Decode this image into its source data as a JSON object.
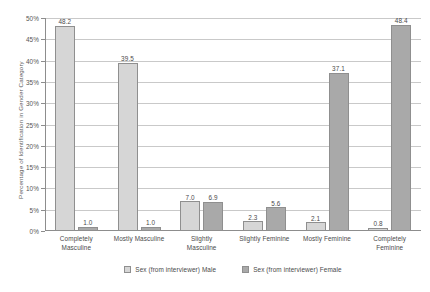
{
  "chart_data": {
    "type": "bar",
    "title": "",
    "xlabel": "",
    "ylabel": "Percentage of Identification in Gender Category",
    "categories": [
      "Completely Masculine",
      "Mostly Masculine",
      "Slightly Masculine",
      "Slightly Feminine",
      "Mostly Feminine",
      "Completely Feminine"
    ],
    "category_lines": [
      [
        "Completely",
        "Masculine"
      ],
      [
        "Mostly Masculine"
      ],
      [
        "Slightly",
        "Masculine"
      ],
      [
        "Slightly Feminine"
      ],
      [
        "Mostly Feminine"
      ],
      [
        "Completely",
        "Feminine"
      ]
    ],
    "series": [
      {
        "name": "Sex (from interviewer) Male",
        "color": "#d6d6d6",
        "values": [
          48.2,
          39.5,
          7.0,
          2.3,
          2.1,
          0.8
        ],
        "labels": [
          "48.2",
          "39.5",
          "7.0",
          "2.3",
          "2.1",
          "0.8"
        ]
      },
      {
        "name": "Sex (from interviewer) Female",
        "color": "#a9a9a9",
        "values": [
          1.0,
          1.0,
          6.9,
          5.6,
          37.1,
          48.4
        ],
        "labels": [
          "1.0",
          "1.0",
          "6.9",
          "5.6",
          "37.1",
          "48.4"
        ]
      }
    ],
    "ylim": [
      0,
      50
    ],
    "ytick_values": [
      0,
      5,
      10,
      15,
      20,
      25,
      30,
      35,
      40,
      45,
      50
    ],
    "ytick_labels": [
      "0%",
      "5%",
      "10%",
      "15%",
      "20%",
      "25%",
      "30%",
      "35%",
      "40%",
      "45%",
      "50%"
    ],
    "grid": true,
    "legend_position": "bottom"
  },
  "legend": {
    "items": [
      {
        "label": "Sex (from interviewer) Male",
        "swatch": "male"
      },
      {
        "label": "Sex (from interviewer) Female",
        "swatch": "female"
      }
    ]
  },
  "colors": {
    "male_bar": "#d6d6d6",
    "female_bar": "#a9a9a9",
    "bar_border": "#8f8f8f",
    "gridline": "#c9c9c9",
    "axis": "#8d8d8d",
    "text": "#4a4a4a",
    "background": "#ffffff"
  }
}
